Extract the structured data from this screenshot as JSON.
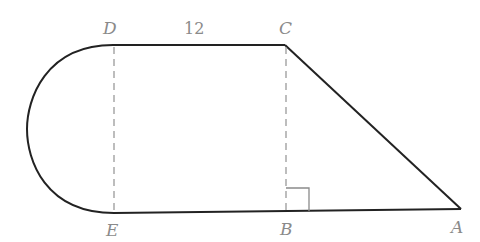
{
  "figure": {
    "points": {
      "D": {
        "label": "D",
        "x": 113,
        "y": 45
      },
      "C": {
        "label": "C",
        "x": 285,
        "y": 45
      },
      "E": {
        "label": "E",
        "x": 114,
        "y": 213
      },
      "B": {
        "label": "B",
        "x": 286,
        "y": 211
      },
      "A": {
        "label": "A",
        "x": 461,
        "y": 209
      }
    },
    "measurements": {
      "DC": "12"
    },
    "colors": {
      "outline": "#222222",
      "dashed": "#9a9a9a",
      "label": "#8a8a8a",
      "right_angle": "#8a8a8a"
    }
  }
}
